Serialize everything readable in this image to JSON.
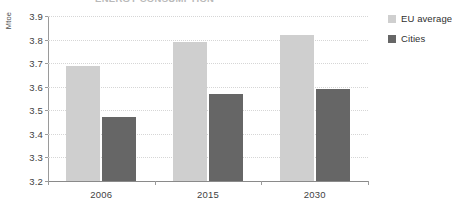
{
  "title_clipped": "ENERGY CONSUMPTION",
  "chart_data": {
    "type": "bar",
    "title": "ENERGY CONSUMPTION",
    "xlabel": "",
    "ylabel": "Mtoe",
    "ylim": [
      3.2,
      3.9
    ],
    "ytick_step": 0.1,
    "yticks": [
      "3.9",
      "3.8",
      "3.7",
      "3.6",
      "3.5",
      "3.4",
      "3.3",
      "3.2"
    ],
    "ytick_values": [
      3.9,
      3.8,
      3.7,
      3.6,
      3.5,
      3.4,
      3.3,
      3.2
    ],
    "categories": [
      "2006",
      "2015",
      "2030"
    ],
    "grid": true,
    "legend_position": "right",
    "series": [
      {
        "name": "EU average",
        "color": "#cfcfcf",
        "values": [
          3.69,
          3.79,
          3.82
        ]
      },
      {
        "name": "Cities",
        "color": "#666666",
        "values": [
          3.47,
          3.57,
          3.59
        ]
      }
    ]
  }
}
